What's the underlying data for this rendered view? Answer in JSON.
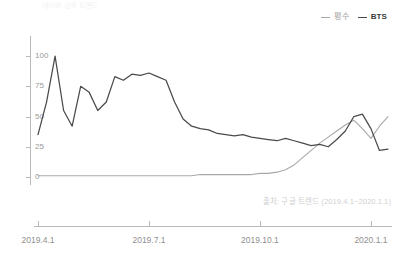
{
  "top_partial_text": "네이버 검색 트렌드",
  "legend": {
    "position": "top-right",
    "items": [
      {
        "label": "평수",
        "color": "#a8a8a8",
        "name": "average"
      },
      {
        "label": "BTS",
        "color": "#4a4a4a",
        "name": "bts"
      }
    ]
  },
  "source_note": "출처: 구글 트렌드 (2019.4.1~2020.1.1)",
  "chart_data": {
    "type": "line",
    "title": "",
    "subtitle": "",
    "xlabel": "",
    "ylabel": "",
    "grid": false,
    "legend_position": "top-right",
    "ylim": [
      0,
      110
    ],
    "yticks": [
      0,
      25,
      50,
      75,
      100
    ],
    "ytick_labels": [
      "0",
      "25",
      "50",
      "75",
      "100"
    ],
    "xtick_labels": [
      "2019.4.1",
      "2019.7.1",
      "2019.10.1",
      "2020.1.1"
    ],
    "xtick_positions": [
      0,
      13,
      26,
      39
    ],
    "x_range": [
      0,
      41
    ],
    "series": [
      {
        "name": "BTS",
        "color": "#4a4a4a",
        "x": [
          0,
          1,
          2,
          3,
          4,
          5,
          6,
          7,
          8,
          9,
          10,
          11,
          12,
          13,
          14,
          15,
          16,
          17,
          18,
          19,
          20,
          21,
          22,
          23,
          24,
          25,
          26,
          27,
          28,
          29,
          30,
          31,
          32,
          33,
          34,
          35,
          36,
          37,
          38,
          39,
          40,
          41
        ],
        "values": [
          35,
          62,
          100,
          55,
          42,
          75,
          70,
          55,
          62,
          83,
          80,
          85,
          84,
          86,
          83,
          80,
          62,
          48,
          42,
          40,
          39,
          36,
          35,
          34,
          35,
          33,
          32,
          31,
          30,
          32,
          30,
          28,
          26,
          27,
          25,
          31,
          38,
          50,
          52,
          40,
          22,
          23
        ]
      },
      {
        "name": "평수",
        "color": "#a8a8a8",
        "x": [
          0,
          1,
          2,
          3,
          4,
          5,
          6,
          7,
          8,
          9,
          10,
          11,
          12,
          13,
          14,
          15,
          16,
          17,
          18,
          19,
          20,
          21,
          22,
          23,
          24,
          25,
          26,
          27,
          28,
          29,
          30,
          31,
          32,
          33,
          34,
          35,
          36,
          37,
          38,
          39,
          40,
          41
        ],
        "values": [
          1,
          1,
          1,
          1,
          1,
          1,
          1,
          1,
          1,
          1,
          1,
          1,
          1,
          1,
          1,
          1,
          1,
          1,
          1,
          2,
          2,
          2,
          2,
          2,
          2,
          2,
          3,
          3,
          4,
          6,
          10,
          16,
          22,
          28,
          33,
          38,
          43,
          47,
          40,
          32,
          42,
          50
        ]
      }
    ]
  },
  "plot_geometry": {
    "left": 38,
    "right": 388,
    "top": 44,
    "bottom": 177,
    "axis_y_top": 36,
    "axis_y_bottom": 185,
    "xaxis_y": 226,
    "xaxis_left": 34,
    "xaxis_right": 392
  }
}
